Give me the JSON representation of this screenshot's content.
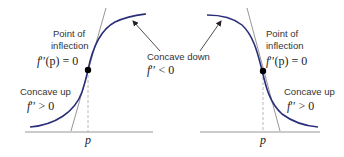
{
  "colors": {
    "curve": "#2b2f7a",
    "axis": "#8a8a8a",
    "tangent": "#8a8a8a",
    "dashed": "#b0b0b0",
    "point": "#000000",
    "text": "#333333"
  },
  "left_panel": {
    "inflection_label_line1": "Point of",
    "inflection_label_line2": "inflection",
    "inflection_eq_f": "f",
    "inflection_eq_primes": "′′",
    "inflection_eq_rest": "(p) = 0",
    "concave_up_label": "Concave up",
    "concave_up_eq_f": "f",
    "concave_up_eq_primes": "′′",
    "concave_up_eq_rest": " > 0",
    "concave_down_label": "Concave down",
    "concave_down_eq_f": "f",
    "concave_down_eq_primes": "′′",
    "concave_down_eq_rest": " < 0",
    "axis_label": "p"
  },
  "right_panel": {
    "inflection_label_line1": "Point of",
    "inflection_label_line2": "inflection",
    "inflection_eq_f": "f",
    "inflection_eq_primes": "′′",
    "inflection_eq_rest": "(p) = 0",
    "concave_up_label": "Concave up",
    "concave_up_eq_f": "f",
    "concave_up_eq_primes": "′′",
    "concave_up_eq_rest": " > 0",
    "axis_label": "p"
  }
}
